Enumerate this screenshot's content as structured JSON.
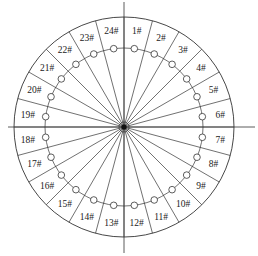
{
  "diagram": {
    "type": "radial-sector-layout",
    "center": [
      124,
      127
    ],
    "outer_radius": 110,
    "ring_radius": 79,
    "label_radius": 97,
    "hub_radius": 5,
    "sector_count": 24,
    "sector_angle_deg": 15,
    "line_color": "#333333",
    "axes": {
      "horizontal": {
        "x1": 8,
        "x2": 255,
        "y": 127
      },
      "vertical": {
        "x": 124,
        "y1": 2,
        "y2": 253
      }
    },
    "labels": [
      "1#",
      "2#",
      "3#",
      "4#",
      "5#",
      "6#",
      "7#",
      "8#",
      "9#",
      "10#",
      "11#",
      "12#",
      "13#",
      "14#",
      "15#",
      "16#",
      "17#",
      "18#",
      "19#",
      "20#",
      "21#",
      "22#",
      "23#",
      "24#"
    ]
  }
}
